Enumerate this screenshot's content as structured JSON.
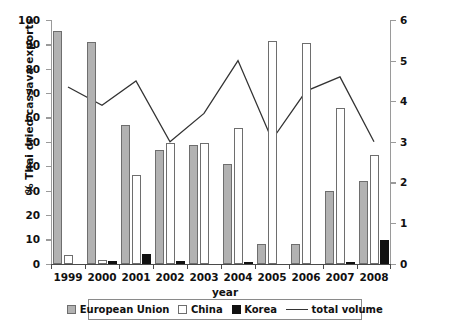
{
  "chart_data": {
    "type": "bar",
    "title": "",
    "subtitle": "",
    "xlabel": "year",
    "ylabel": "% Thai dried cassava exports",
    "y2label": "tonnes, millions",
    "categories": [
      "1999",
      "2000",
      "2001",
      "2002",
      "2003",
      "2004",
      "2005",
      "2006",
      "2007",
      "2008"
    ],
    "ylim": [
      0,
      100
    ],
    "yticks": [
      0,
      10,
      20,
      30,
      40,
      50,
      60,
      70,
      80,
      90,
      100
    ],
    "y2lim": [
      0,
      6
    ],
    "y2ticks": [
      0,
      1,
      2,
      3,
      4,
      5,
      6
    ],
    "grid": false,
    "legend_position": "bottom",
    "series": [
      {
        "name": "European Union",
        "type": "bar",
        "color": "#b2b2b2",
        "axis": "left",
        "values": [
          95.5,
          91.0,
          57.0,
          46.5,
          48.5,
          41.0,
          8.0,
          8.0,
          30.0,
          34.0
        ]
      },
      {
        "name": "China",
        "type": "bar",
        "color": "#ffffff",
        "axis": "left",
        "values": [
          3.5,
          1.5,
          36.5,
          49.5,
          49.5,
          55.5,
          91.5,
          90.5,
          64.0,
          44.5
        ]
      },
      {
        "name": "Korea",
        "type": "bar",
        "color": "#111111",
        "axis": "left",
        "values": [
          0.0,
          1.0,
          4.0,
          1.0,
          0.0,
          0.5,
          0.0,
          0.0,
          0.3,
          9.5
        ]
      },
      {
        "name": "total volume",
        "type": "line",
        "color": "#333333",
        "axis": "right",
        "values": [
          4.35,
          3.9,
          4.5,
          3.0,
          3.7,
          5.0,
          3.05,
          4.25,
          4.6,
          3.0
        ]
      }
    ]
  },
  "legend": {
    "items": [
      {
        "label": "European Union",
        "marker": "square-gray"
      },
      {
        "label": "China",
        "marker": "square-white"
      },
      {
        "label": "Korea",
        "marker": "square-black"
      },
      {
        "label": "total volume",
        "marker": "line"
      }
    ]
  }
}
